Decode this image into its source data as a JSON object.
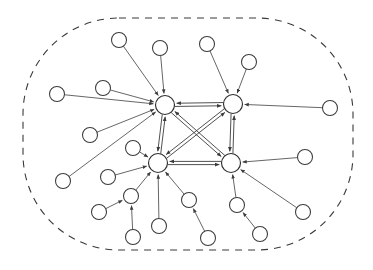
{
  "diagram": {
    "type": "directed-graph",
    "canvas": {
      "width": 373,
      "height": 270
    },
    "style": {
      "background": "#ffffff",
      "node_fill": "#ffffff",
      "node_stroke": "#3a3a3a",
      "edge_color": "#4a4a4a",
      "boundary_color": "#3a3a3a",
      "boundary_dash": "7 6"
    },
    "boundary": {
      "name": "system-boundary",
      "shape": "rounded-rectangle",
      "x": 23,
      "y": 18,
      "width": 330,
      "height": 232,
      "corner_radius": 96,
      "dashed": true
    },
    "hubs": [
      {
        "id": "hub-top-left",
        "label": "",
        "cx": 165,
        "cy": 105,
        "r": 9.5
      },
      {
        "id": "hub-top-right",
        "label": "",
        "cx": 233,
        "cy": 104,
        "r": 9.5
      },
      {
        "id": "hub-bottom-left",
        "label": "",
        "cx": 158,
        "cy": 163,
        "r": 9.5
      },
      {
        "id": "hub-bottom-right",
        "label": "",
        "cx": 231,
        "cy": 163,
        "r": 9.5
      }
    ],
    "leaves": [
      {
        "id": "leaf-01",
        "cx": 119,
        "cy": 40,
        "r": 7.5
      },
      {
        "id": "leaf-02",
        "cx": 160,
        "cy": 48,
        "r": 7.5
      },
      {
        "id": "leaf-03",
        "cx": 207,
        "cy": 44,
        "r": 7.5
      },
      {
        "id": "leaf-04",
        "cx": 249,
        "cy": 62,
        "r": 7.5
      },
      {
        "id": "leaf-05",
        "cx": 57,
        "cy": 94,
        "r": 7.5
      },
      {
        "id": "leaf-06",
        "cx": 103,
        "cy": 88,
        "r": 7.5
      },
      {
        "id": "leaf-07",
        "cx": 330,
        "cy": 108,
        "r": 7.5
      },
      {
        "id": "leaf-08",
        "cx": 90,
        "cy": 135,
        "r": 7.5
      },
      {
        "id": "leaf-09",
        "cx": 133,
        "cy": 148,
        "r": 7.5
      },
      {
        "id": "leaf-10",
        "cx": 63,
        "cy": 181,
        "r": 7.5
      },
      {
        "id": "leaf-11",
        "cx": 108,
        "cy": 177,
        "r": 7.5
      },
      {
        "id": "leaf-12",
        "cx": 305,
        "cy": 157,
        "r": 7.5
      },
      {
        "id": "leaf-13",
        "cx": 131,
        "cy": 196,
        "r": 7.5
      },
      {
        "id": "leaf-14",
        "cx": 99,
        "cy": 212,
        "r": 7.5
      },
      {
        "id": "leaf-15",
        "cx": 133,
        "cy": 237,
        "r": 7.5
      },
      {
        "id": "leaf-16",
        "cx": 159,
        "cy": 226,
        "r": 7.5
      },
      {
        "id": "leaf-17",
        "cx": 189,
        "cy": 200,
        "r": 7.5
      },
      {
        "id": "leaf-18",
        "cx": 208,
        "cy": 238,
        "r": 7.5
      },
      {
        "id": "leaf-19",
        "cx": 237,
        "cy": 205,
        "r": 7.5
      },
      {
        "id": "leaf-20",
        "cx": 260,
        "cy": 234,
        "r": 7.5
      },
      {
        "id": "leaf-21",
        "cx": 303,
        "cy": 212,
        "r": 7.5
      }
    ],
    "core_edges": [
      {
        "from": "hub-top-left",
        "to": "hub-top-right",
        "bidirectional": true
      },
      {
        "from": "hub-top-left",
        "to": "hub-bottom-left",
        "bidirectional": true
      },
      {
        "from": "hub-top-left",
        "to": "hub-bottom-right",
        "bidirectional": true
      },
      {
        "from": "hub-top-right",
        "to": "hub-bottom-left",
        "bidirectional": true
      },
      {
        "from": "hub-top-right",
        "to": "hub-bottom-right",
        "bidirectional": true
      },
      {
        "from": "hub-bottom-left",
        "to": "hub-bottom-right",
        "bidirectional": true
      }
    ],
    "leaf_edges": [
      {
        "from": "leaf-01",
        "to": "hub-top-left"
      },
      {
        "from": "leaf-02",
        "to": "hub-top-left"
      },
      {
        "from": "leaf-05",
        "to": "hub-top-left"
      },
      {
        "from": "leaf-06",
        "to": "hub-top-left"
      },
      {
        "from": "leaf-08",
        "to": "hub-top-left"
      },
      {
        "from": "leaf-10",
        "to": "hub-top-left"
      },
      {
        "from": "leaf-03",
        "to": "hub-top-right"
      },
      {
        "from": "leaf-04",
        "to": "hub-top-right"
      },
      {
        "from": "leaf-07",
        "to": "hub-top-right"
      },
      {
        "from": "leaf-09",
        "to": "hub-bottom-left"
      },
      {
        "from": "leaf-11",
        "to": "hub-bottom-left"
      },
      {
        "from": "leaf-13",
        "to": "hub-bottom-left"
      },
      {
        "from": "leaf-16",
        "to": "hub-bottom-left"
      },
      {
        "from": "leaf-17",
        "to": "hub-bottom-left"
      },
      {
        "from": "leaf-12",
        "to": "hub-bottom-right"
      },
      {
        "from": "leaf-19",
        "to": "hub-bottom-right"
      },
      {
        "from": "leaf-21",
        "to": "hub-bottom-right"
      },
      {
        "from": "leaf-14",
        "to": "leaf-13"
      },
      {
        "from": "leaf-15",
        "to": "leaf-13"
      },
      {
        "from": "leaf-18",
        "to": "leaf-17"
      },
      {
        "from": "leaf-20",
        "to": "leaf-19"
      }
    ],
    "counts": {
      "hub_count": 4,
      "leaf_count": 21,
      "core_edge_count": 6,
      "leaf_edge_count": 21
    }
  }
}
